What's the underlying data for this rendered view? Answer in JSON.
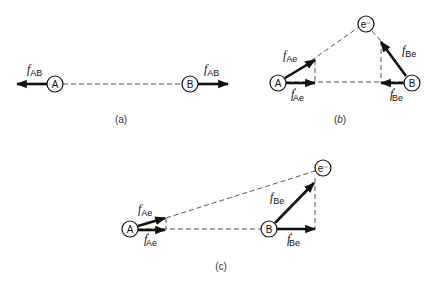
{
  "diagram": {
    "colors": {
      "ink": "#111111",
      "dashed": "#555555",
      "background": "#ffffff"
    },
    "panels": [
      {
        "id": "a",
        "caption": "(a)",
        "nodes": {
          "A": "A",
          "B": "B"
        },
        "forces": [
          {
            "symbol": "f",
            "subscript": "AB",
            "prime": ""
          },
          {
            "symbol": "f",
            "subscript": "AB",
            "prime": ""
          }
        ]
      },
      {
        "id": "b",
        "caption_open": "(",
        "caption_letter": "b",
        "caption_close": ")",
        "nodes": {
          "A": "A",
          "B": "B",
          "e": "e⁻"
        },
        "forces": [
          {
            "symbol": "f",
            "subscript": "Ae",
            "prime": ""
          },
          {
            "symbol": "f",
            "subscript": "Ae",
            "prime": "′"
          },
          {
            "symbol": "f",
            "subscript": "Be",
            "prime": ""
          },
          {
            "symbol": "f",
            "subscript": "Be",
            "prime": "′"
          }
        ]
      },
      {
        "id": "c",
        "caption": "(c)",
        "nodes": {
          "A": "A",
          "B": "B",
          "e": "e⁻"
        },
        "forces": [
          {
            "symbol": "f",
            "subscript": "Ae",
            "prime": ""
          },
          {
            "symbol": "f",
            "subscript": "Ae",
            "prime": "′"
          },
          {
            "symbol": "f",
            "subscript": "Be",
            "prime": ""
          },
          {
            "symbol": "f",
            "subscript": "Be",
            "prime": "′"
          }
        ]
      }
    ]
  }
}
